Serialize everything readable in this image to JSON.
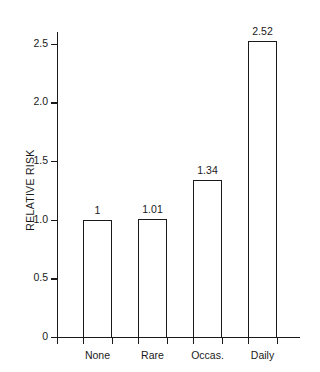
{
  "chart_data": {
    "type": "bar",
    "title": "",
    "subtitle": "",
    "xlabel": "",
    "ylabel": "RELATIVE RISK",
    "categories": [
      "None",
      "Rare",
      "Occas.",
      "Daily"
    ],
    "values": [
      1,
      1.01,
      1.34,
      2.52
    ],
    "value_labels": [
      "1",
      "1.01",
      "1.34",
      "2.52"
    ],
    "ylim": [
      0,
      2.6
    ],
    "yticks": [
      0,
      0.5,
      1.0,
      1.5,
      2.0,
      2.5
    ],
    "ytick_labels": [
      "0",
      "0.5",
      "1.0",
      "1.5",
      "2.0",
      "2.5"
    ],
    "grid": false,
    "legend": null,
    "legend_position": "none",
    "bar_fill": "#ffffff",
    "bar_edge": "#1a1a1a",
    "background": "#ffffff"
  }
}
